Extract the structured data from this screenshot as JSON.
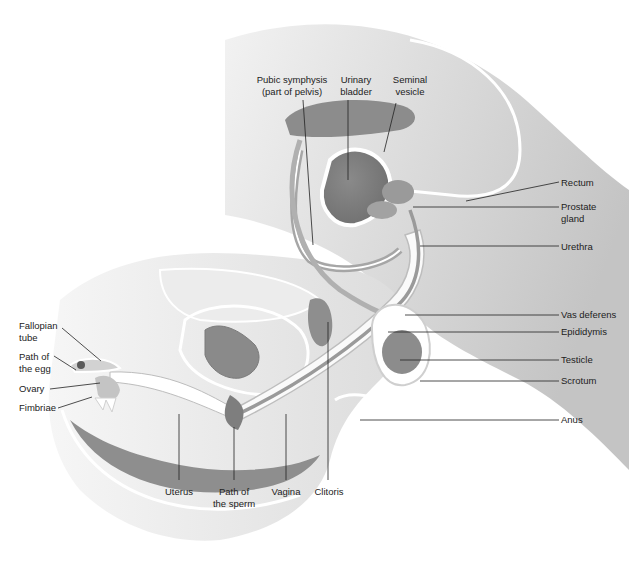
{
  "diagram": {
    "type": "anatomical-illustration",
    "colors": {
      "background": "#ffffff",
      "tissue_light": "#e6e6e6",
      "tissue_mid": "#c9c9c9",
      "tissue_dark": "#9a9a9a",
      "organ_dark": "#7d7d7d",
      "outline": "#ffffff",
      "leader_line": "#222222",
      "text": "#222222"
    },
    "labels": [
      {
        "id": "pubic-symphysis",
        "text": "Pubic symphysis\n(part of pelvis)",
        "x": 282,
        "y": 74,
        "align": "center",
        "line": [
          [
            303,
            100
          ],
          [
            313,
            245
          ]
        ]
      },
      {
        "id": "urinary-bladder",
        "text": "Urinary\nbladder",
        "x": 362,
        "y": 74,
        "align": "center",
        "line": [
          [
            348,
            100
          ],
          [
            348,
            180
          ]
        ]
      },
      {
        "id": "seminal-vesicle",
        "text": "Seminal\nvesicle",
        "x": 420,
        "y": 74,
        "align": "center",
        "line": [
          [
            396,
            103
          ],
          [
            384,
            152
          ]
        ]
      },
      {
        "id": "rectum",
        "text": "Rectum",
        "x": 561,
        "y": 178,
        "align": "left",
        "line": [
          [
            559,
            182
          ],
          [
            466,
            201
          ]
        ]
      },
      {
        "id": "prostate-gland",
        "text": "Prostate\ngland",
        "x": 561,
        "y": 201,
        "align": "left",
        "line": [
          [
            559,
            207
          ],
          [
            413,
            207
          ]
        ]
      },
      {
        "id": "urethra",
        "text": "Urethra",
        "x": 561,
        "y": 242,
        "align": "left",
        "line": [
          [
            559,
            246
          ],
          [
            420,
            246
          ]
        ]
      },
      {
        "id": "vas-deferens",
        "text": "Vas deferens",
        "x": 561,
        "y": 310,
        "align": "left",
        "line": [
          [
            559,
            315
          ],
          [
            405,
            315
          ]
        ]
      },
      {
        "id": "epididymis",
        "text": "Epididymis",
        "x": 561,
        "y": 326,
        "align": "left",
        "line": [
          [
            559,
            332
          ],
          [
            388,
            332
          ]
        ]
      },
      {
        "id": "testicle",
        "text": "Testicle",
        "x": 561,
        "y": 354,
        "align": "left",
        "line": [
          [
            559,
            360
          ],
          [
            400,
            360
          ]
        ]
      },
      {
        "id": "scrotum",
        "text": "Scrotum",
        "x": 561,
        "y": 375,
        "align": "left",
        "line": [
          [
            559,
            381
          ],
          [
            420,
            381
          ]
        ]
      },
      {
        "id": "anus",
        "text": "Anus",
        "x": 561,
        "y": 415,
        "align": "left",
        "line": [
          [
            559,
            420
          ],
          [
            360,
            420
          ]
        ]
      },
      {
        "id": "fallopian-tube",
        "text": "Fallopian\ntube",
        "x": 19,
        "y": 321,
        "align": "left",
        "line": [
          [
            62,
            328
          ],
          [
            101,
            361
          ]
        ]
      },
      {
        "id": "path-of-egg",
        "text": "Path of\nthe egg",
        "x": 19,
        "y": 352,
        "align": "left",
        "line": [
          [
            54,
            356
          ],
          [
            76,
            370
          ]
        ]
      },
      {
        "id": "ovary",
        "text": "Ovary",
        "x": 19,
        "y": 384,
        "align": "left",
        "line": [
          [
            50,
            389
          ],
          [
            100,
            383
          ]
        ]
      },
      {
        "id": "fimbriae",
        "text": "Fimbriae",
        "x": 19,
        "y": 403,
        "align": "left",
        "line": [
          [
            58,
            408
          ],
          [
            92,
            397
          ]
        ]
      },
      {
        "id": "uterus",
        "text": "Uterus",
        "x": 163,
        "y": 486,
        "align": "center",
        "line": [
          [
            179,
            414
          ],
          [
            179,
            480
          ]
        ]
      },
      {
        "id": "path-of-sperm",
        "text": "Path of\nthe sperm",
        "x": 216,
        "y": 486,
        "align": "center",
        "line": [
          [
            234,
            427
          ],
          [
            234,
            480
          ]
        ]
      },
      {
        "id": "vagina",
        "text": "Vagina",
        "x": 271,
        "y": 486,
        "align": "center",
        "line": [
          [
            286,
            414
          ],
          [
            286,
            480
          ]
        ]
      },
      {
        "id": "clitoris",
        "text": "Clitoris",
        "x": 322,
        "y": 486,
        "align": "center",
        "line": [
          [
            328,
            322
          ],
          [
            328,
            480
          ]
        ]
      }
    ]
  }
}
